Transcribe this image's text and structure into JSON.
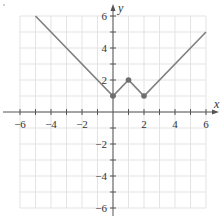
{
  "chart_data": {
    "type": "line",
    "title": "",
    "xlabel": "x",
    "ylabel": "y",
    "xlim": [
      -6,
      6
    ],
    "ylim": [
      -6,
      6
    ],
    "grid": true,
    "x_ticks": [
      -6,
      -5,
      -4,
      -3,
      -2,
      -1,
      0,
      1,
      2,
      3,
      4,
      5,
      6
    ],
    "y_ticks": [
      -6,
      -5,
      -4,
      -3,
      -2,
      -1,
      0,
      1,
      2,
      3,
      4,
      5,
      6
    ],
    "x_tick_labels": [
      "−6",
      "−4",
      "−2",
      "2",
      "4",
      "6"
    ],
    "x_tick_label_values": [
      -6,
      -4,
      -2,
      2,
      4,
      6
    ],
    "y_tick_labels": [
      "6",
      "4",
      "2",
      "−2",
      "−4",
      "−6"
    ],
    "y_tick_label_values": [
      6,
      4,
      2,
      -2,
      -4,
      -6
    ],
    "series": [
      {
        "name": "f(x)",
        "x": [
          -5,
          0,
          1,
          2,
          6
        ],
        "y": [
          6,
          1,
          2,
          1,
          5
        ],
        "color": "#7f7f7f"
      }
    ],
    "points": [
      {
        "x": 0,
        "y": 1
      },
      {
        "x": 1,
        "y": 2
      },
      {
        "x": 2,
        "y": 1
      }
    ],
    "point_color": "#6e6e6e",
    "grid_color": "#e3e3e3",
    "axis_color": "#555555"
  }
}
